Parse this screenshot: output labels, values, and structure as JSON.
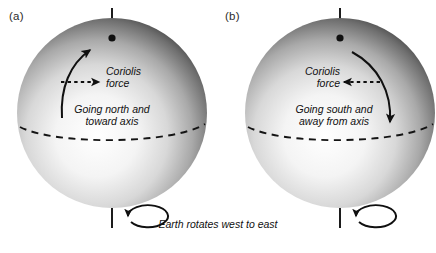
{
  "figure": {
    "caption": "Earth rotates west to east",
    "panels": [
      {
        "id": "a",
        "label": "(a)",
        "force_label_line1": "Coriolis",
        "force_label_line2": "force",
        "motion_label_line1": "Going north and",
        "motion_label_line2": "toward axis",
        "force_arrow_direction": "right",
        "motion_arrow_direction": "up-right",
        "rotation_label": "counterclockwise-loop"
      },
      {
        "id": "b",
        "label": "(b)",
        "force_label_line1": "Coriolis",
        "force_label_line2": "force",
        "motion_label_line1": "Going south and",
        "motion_label_line2": "away from axis",
        "force_arrow_direction": "left",
        "motion_arrow_direction": "down-right",
        "rotation_label": "counterclockwise-loop"
      }
    ]
  },
  "colors": {
    "sphere_light": "#ffffff",
    "sphere_mid": "#b9b9b9",
    "sphere_dark": "#2e2e2e",
    "ink": "#101010",
    "background": "#ffffff"
  }
}
